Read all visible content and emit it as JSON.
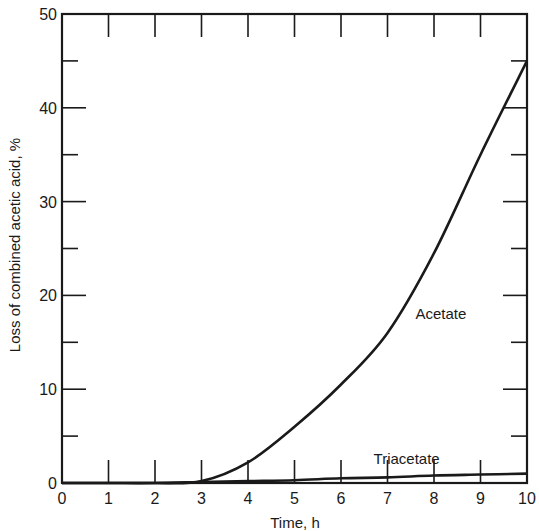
{
  "chart_data": {
    "type": "line",
    "title": "",
    "xlabel": "Time, h",
    "ylabel": "Loss of combined acetic acid, %",
    "xlim": [
      0,
      10
    ],
    "ylim": [
      0,
      50
    ],
    "x_ticks": [
      "0",
      "1",
      "2",
      "3",
      "4",
      "5",
      "6",
      "7",
      "8",
      "9",
      "10"
    ],
    "y_ticks": [
      "0",
      "10",
      "20",
      "30",
      "40",
      "50"
    ],
    "grid": false,
    "legend": "inline labels",
    "x": [
      0,
      1,
      2,
      3,
      4,
      5,
      6,
      7,
      8,
      9,
      10
    ],
    "series": [
      {
        "name": "Acetate",
        "values": [
          0,
          0,
          0,
          0.2,
          2.2,
          6.0,
          10.5,
          16.0,
          24.5,
          35.0,
          45.0
        ]
      },
      {
        "name": "Triacetate",
        "values": [
          0,
          0,
          0,
          0.1,
          0.2,
          0.3,
          0.5,
          0.6,
          0.8,
          0.9,
          1.0
        ]
      }
    ],
    "annotations": [
      {
        "text": "Acetate",
        "x": 7.6,
        "y": 17.5
      },
      {
        "text": "Triacetate",
        "x": 6.7,
        "y": 2.0
      }
    ]
  }
}
